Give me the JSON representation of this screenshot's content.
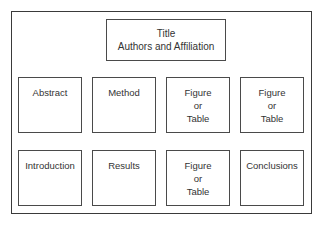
{
  "diagram": {
    "title_box": {
      "line1": "Title",
      "line2": "Authors and Affiliation"
    },
    "row1": [
      {
        "lines": [
          "Abstract"
        ]
      },
      {
        "lines": [
          "Method"
        ]
      },
      {
        "lines": [
          "Figure",
          "or",
          "Table"
        ]
      },
      {
        "lines": [
          "Figure",
          "or",
          "Table"
        ]
      }
    ],
    "row2": [
      {
        "lines": [
          "Introduction"
        ]
      },
      {
        "lines": [
          "Results"
        ]
      },
      {
        "lines": [
          "Figure",
          "or",
          "Table"
        ]
      },
      {
        "lines": [
          "Conclusions"
        ]
      }
    ]
  }
}
